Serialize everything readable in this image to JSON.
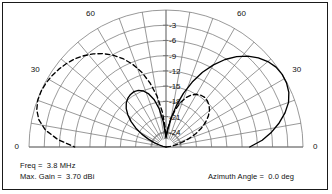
{
  "plot": {
    "type": "polar-elevation-pattern",
    "frame_border_color": "#1a1a1a",
    "background_color": "#ffffff",
    "grid_color": "#6d6d6d",
    "trace_color": "#000000"
  },
  "annotations": {
    "freq": "Freq =  3.8 MHz",
    "max_gain": "Max. Gain =  3.70 dBi",
    "azimuth": "Azimuth Angle =  0.0 deg"
  },
  "chart_data": {
    "type": "line",
    "subtype": "polar-elevation-radiation-pattern",
    "title": "",
    "xlabel": "",
    "ylabel": "",
    "angle_unit": "deg",
    "radial_unit": "dB",
    "radial_label_unit": "dB relative to max gain",
    "angular_range": [
      0,
      180
    ],
    "angular_tick_step": 10,
    "angular_labeled_ticks": [
      {
        "angle": 0,
        "label": "0",
        "side": "right"
      },
      {
        "angle": 30,
        "label": "30",
        "side": "right"
      },
      {
        "angle": 60,
        "label": "60",
        "side": "right"
      },
      {
        "angle": 90,
        "label": "90",
        "side": "top"
      },
      {
        "angle": 120,
        "label": "60",
        "side": "left"
      },
      {
        "angle": 150,
        "label": "30",
        "side": "left"
      },
      {
        "angle": 180,
        "label": "0",
        "side": "left"
      }
    ],
    "radial_ring_labels": [
      "-3",
      "-6",
      "-9",
      "-12",
      "-15",
      "-18",
      "-21",
      "-24"
    ],
    "radial_ring_values": [
      -3,
      -6,
      -9,
      -12,
      -15,
      -18,
      -21,
      -24
    ],
    "radial_outer_value": 0,
    "radial_min_value": -27,
    "grid": true,
    "legend_position": "none",
    "series": [
      {
        "name": "solid-pattern",
        "style": "solid",
        "color": "#000000",
        "points_deg_db": [
          [
            0,
            -10.5
          ],
          [
            4,
            -8.0
          ],
          [
            8,
            -6.0
          ],
          [
            12,
            -4.2
          ],
          [
            16,
            -2.6
          ],
          [
            20,
            -1.3
          ],
          [
            24,
            -0.5
          ],
          [
            28,
            -0.1
          ],
          [
            32,
            0.0
          ],
          [
            36,
            -0.2
          ],
          [
            40,
            -0.8
          ],
          [
            44,
            -1.7
          ],
          [
            48,
            -2.9
          ],
          [
            52,
            -4.4
          ],
          [
            56,
            -6.2
          ],
          [
            60,
            -8.3
          ],
          [
            64,
            -10.6
          ],
          [
            68,
            -13.2
          ],
          [
            72,
            -15.9
          ],
          [
            76,
            -18.6
          ],
          [
            80,
            -21.2
          ],
          [
            84,
            -23.4
          ],
          [
            88,
            -24.8
          ],
          [
            90,
            -25.2
          ],
          [
            92,
            -24.6
          ],
          [
            96,
            -22.0
          ],
          [
            100,
            -19.4
          ],
          [
            104,
            -17.4
          ],
          [
            108,
            -16.0
          ],
          [
            112,
            -15.1
          ],
          [
            116,
            -14.6
          ],
          [
            120,
            -14.4
          ],
          [
            124,
            -14.5
          ],
          [
            128,
            -14.8
          ],
          [
            132,
            -15.3
          ],
          [
            136,
            -16.1
          ],
          [
            140,
            -17.2
          ],
          [
            144,
            -18.5
          ],
          [
            148,
            -20.0
          ],
          [
            152,
            -21.6
          ],
          [
            156,
            -23.2
          ],
          [
            160,
            -24.6
          ],
          [
            164,
            -25.7
          ],
          [
            168,
            -26.4
          ],
          [
            172,
            -26.9
          ],
          [
            176,
            -27.0
          ],
          [
            180,
            -27.0
          ]
        ]
      },
      {
        "name": "dashed-pattern",
        "style": "dashed",
        "color": "#000000",
        "points_deg_db": [
          [
            0,
            -27.0
          ],
          [
            4,
            -26.8
          ],
          [
            8,
            -26.2
          ],
          [
            12,
            -25.2
          ],
          [
            16,
            -23.8
          ],
          [
            20,
            -22.2
          ],
          [
            24,
            -20.6
          ],
          [
            28,
            -19.1
          ],
          [
            32,
            -17.8
          ],
          [
            36,
            -16.7
          ],
          [
            40,
            -15.8
          ],
          [
            44,
            -15.2
          ],
          [
            48,
            -14.8
          ],
          [
            52,
            -14.6
          ],
          [
            56,
            -14.7
          ],
          [
            60,
            -15.0
          ],
          [
            64,
            -15.6
          ],
          [
            68,
            -16.5
          ],
          [
            72,
            -17.8
          ],
          [
            76,
            -19.4
          ],
          [
            80,
            -21.3
          ],
          [
            84,
            -23.2
          ],
          [
            88,
            -24.6
          ],
          [
            90,
            -25.0
          ],
          [
            92,
            -23.4
          ],
          [
            96,
            -20.0
          ],
          [
            100,
            -16.8
          ],
          [
            104,
            -14.0
          ],
          [
            108,
            -11.5
          ],
          [
            112,
            -9.4
          ],
          [
            116,
            -7.6
          ],
          [
            120,
            -6.1
          ],
          [
            124,
            -4.8
          ],
          [
            128,
            -3.7
          ],
          [
            132,
            -2.8
          ],
          [
            136,
            -2.0
          ],
          [
            140,
            -1.4
          ],
          [
            144,
            -0.9
          ],
          [
            148,
            -0.5
          ],
          [
            152,
            -0.2
          ],
          [
            156,
            -0.05
          ],
          [
            160,
            -0.1
          ],
          [
            164,
            -0.5
          ],
          [
            168,
            -1.4
          ],
          [
            172,
            -3.0
          ],
          [
            176,
            -5.6
          ],
          [
            180,
            -9.0
          ]
        ]
      }
    ]
  }
}
